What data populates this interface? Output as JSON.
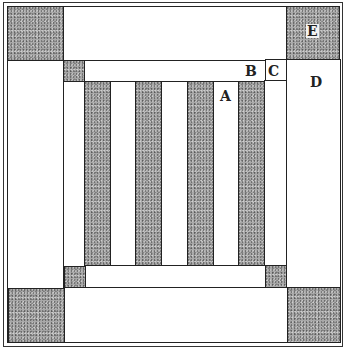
{
  "diagram": {
    "type": "quilt-block",
    "labels": {
      "A": "A",
      "B": "B",
      "C": "C",
      "D": "D",
      "E": "E"
    },
    "colors": {
      "dark_fabric": "#a9a9a9",
      "light_fabric": "#ffffff",
      "outline": "#222222"
    },
    "stripes": {
      "count_dark": 4,
      "count_light": 3
    }
  }
}
